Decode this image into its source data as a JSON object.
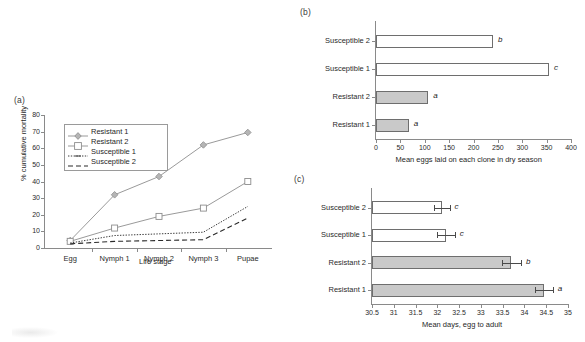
{
  "figure": {
    "panel_a_label": "(a)",
    "panel_b_label": "(b)",
    "panel_c_label": "(c)"
  },
  "chart_data": [
    {
      "panel": "(a)",
      "type": "line",
      "title": "",
      "xlabel": "Life stage",
      "ylabel": "% cumulative mortality",
      "categories": [
        "Egg",
        "Nymph 1",
        "Nymph 2",
        "Nymph 3",
        "Pupae"
      ],
      "ylim": [
        0,
        80
      ],
      "yticks": [
        0,
        10,
        20,
        30,
        40,
        50,
        60,
        70,
        80
      ],
      "grid": false,
      "legend_position": "upper-left-inside",
      "series": [
        {
          "name": "Resistant 1",
          "values": [
            4.5,
            32.0,
            43.0,
            62.0,
            69.5
          ],
          "marker": "diamond",
          "line": "solid",
          "color": "#9a9a9a"
        },
        {
          "name": "Resistant 2",
          "values": [
            4.0,
            12.0,
            19.0,
            24.0,
            40.0
          ],
          "marker": "open-square",
          "line": "solid",
          "color": "#9a9a9a"
        },
        {
          "name": "Susceptible 1",
          "values": [
            3.0,
            7.5,
            8.5,
            9.5,
            25.0
          ],
          "marker": "none",
          "line": "dotted",
          "color": "#3c3c3c"
        },
        {
          "name": "Susceptible 2",
          "values": [
            2.5,
            4.0,
            4.5,
            5.0,
            18.0
          ],
          "marker": "none",
          "line": "dashed",
          "color": "#2a2a2a"
        }
      ]
    },
    {
      "panel": "(b)",
      "type": "bar",
      "orientation": "horizontal",
      "title": "",
      "xlabel": "Mean eggs laid on each clone in dry season",
      "ylabel": "",
      "xlim": [
        0,
        400
      ],
      "xticks": [
        0,
        50,
        100,
        150,
        200,
        250,
        300,
        350,
        400
      ],
      "xtick_labels": [
        "0",
        "50",
        "100",
        "150",
        "200",
        "250",
        "300",
        "350",
        "400"
      ],
      "grid": false,
      "categories": [
        "Resistant 1",
        "Resistant 2",
        "Susceptible 1",
        "Susceptible 2"
      ],
      "values": [
        67,
        107,
        355,
        240
      ],
      "annotations": [
        "a",
        "a",
        "c",
        "b"
      ],
      "fills": [
        "filled",
        "filled",
        "open",
        "open"
      ]
    },
    {
      "panel": "(c)",
      "type": "bar",
      "orientation": "horizontal",
      "title": "",
      "xlabel": "Mean days, egg to adult",
      "ylabel": "",
      "xlim": [
        30.5,
        35
      ],
      "xticks": [
        30.5,
        31,
        31.5,
        32,
        32.5,
        33,
        33.5,
        34,
        34.5,
        35
      ],
      "xtick_labels": [
        "30.5",
        "31",
        "31.5",
        "32",
        "32.5",
        "33",
        "33.5",
        "34",
        "34.5",
        "35"
      ],
      "grid": false,
      "categories": [
        "Resistant 1",
        "Resistant 2",
        "Susceptible 1",
        "Susceptible 2"
      ],
      "values": [
        34.45,
        33.7,
        32.2,
        32.1
      ],
      "errors": [
        0.2,
        0.22,
        0.2,
        0.18
      ],
      "annotations": [
        "a",
        "b",
        "c",
        "c"
      ],
      "fills": [
        "filled",
        "filled",
        "open",
        "open"
      ]
    }
  ]
}
